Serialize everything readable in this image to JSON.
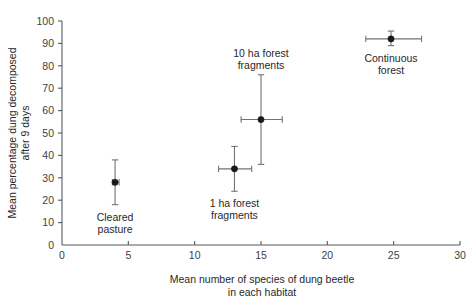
{
  "chart_data": {
    "type": "scatter",
    "title": "",
    "xlabel": "Mean number of species of dung beetle in each habitat",
    "xlabel_line1": "Mean number of species of dung beetle",
    "xlabel_line2": "in each habitat",
    "ylabel": "Mean percentage dung decomposed after 9 days",
    "ylabel_line1": "Mean percentage dung decomposed",
    "ylabel_line2": "after 9 days",
    "xlim": [
      0,
      30
    ],
    "ylim": [
      0,
      100
    ],
    "xticks": [
      0,
      5,
      10,
      15,
      20,
      25,
      30
    ],
    "yticks": [
      0,
      10,
      20,
      30,
      40,
      50,
      60,
      70,
      80,
      90,
      100
    ],
    "xtick_labels": [
      "0",
      "5",
      "10",
      "15",
      "20",
      "25",
      "30"
    ],
    "ytick_labels": [
      "0",
      "10",
      "20",
      "30",
      "40",
      "50",
      "60",
      "70",
      "80",
      "90",
      "100"
    ],
    "grid": false,
    "legend": "none",
    "marker_color": "#17191a",
    "errorbar_color": "#6e7478",
    "axis_color": "#555a5e",
    "points": [
      {
        "label": "Cleared pasture",
        "label_line1": "Cleared",
        "label_line2": "pasture",
        "x": 4.0,
        "y": 28.0,
        "x_err_low": 3.8,
        "x_err_high": 4.3,
        "y_err_low": 18.0,
        "y_err_high": 38.0,
        "label_position": "below"
      },
      {
        "label": "1 ha forest fragments",
        "label_line1": "1 ha forest",
        "label_line2": "fragments",
        "x": 13.0,
        "y": 34.0,
        "x_err_low": 11.8,
        "x_err_high": 14.3,
        "y_err_low": 24.0,
        "y_err_high": 44.0,
        "label_position": "below"
      },
      {
        "label": "10 ha forest fragments",
        "label_line1": "10 ha forest",
        "label_line2": "fragments",
        "x": 15.0,
        "y": 56.0,
        "x_err_low": 13.5,
        "x_err_high": 16.6,
        "y_err_low": 36.0,
        "y_err_high": 76.0,
        "label_position": "above"
      },
      {
        "label": "Continuous forest",
        "label_line1": "Continuous",
        "label_line2": "forest",
        "x": 24.8,
        "y": 92.0,
        "x_err_low": 22.9,
        "x_err_high": 27.1,
        "y_err_low": 89.0,
        "y_err_high": 95.5,
        "label_position": "below"
      }
    ]
  }
}
